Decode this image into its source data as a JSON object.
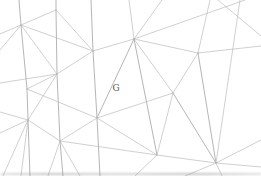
{
  "figure": {
    "background": "#ffffff",
    "label": {
      "text": "G",
      "x": 116,
      "y": 89,
      "color": "#5a5a5a",
      "font_size": 9
    },
    "line_color_normal": "#b7b7b7",
    "line_color_bold": "#a6a6a6",
    "bottom_edge_color": "#969696",
    "vertices": [
      [
        21,
        25
      ],
      [
        56,
        10
      ],
      [
        93,
        51
      ],
      [
        134,
        39
      ],
      [
        198,
        53
      ],
      [
        57,
        74
      ],
      [
        27,
        89
      ],
      [
        28,
        120
      ],
      [
        97,
        118
      ],
      [
        173,
        93
      ],
      [
        60,
        141
      ],
      [
        157,
        155
      ],
      [
        216,
        163
      ]
    ],
    "segments": [
      [
        56,
        0,
        56,
        10,
        "b"
      ],
      [
        56,
        10,
        57,
        74,
        "b"
      ],
      [
        57,
        74,
        60,
        141,
        "b"
      ],
      [
        60,
        141,
        63,
        176,
        "b"
      ],
      [
        91,
        0,
        93,
        51,
        "b"
      ],
      [
        93,
        51,
        97,
        118,
        "b"
      ],
      [
        97,
        118,
        100,
        176,
        "b"
      ],
      [
        19,
        0,
        21,
        25,
        "b"
      ],
      [
        21,
        25,
        27,
        89,
        "b"
      ],
      [
        27,
        89,
        28,
        120,
        "b"
      ],
      [
        28,
        120,
        30,
        176,
        "b"
      ],
      [
        56,
        10,
        0,
        34,
        "n"
      ],
      [
        21,
        25,
        93,
        51,
        "n"
      ],
      [
        21,
        25,
        57,
        74,
        "n"
      ],
      [
        21,
        25,
        0,
        50,
        "n"
      ],
      [
        56,
        10,
        93,
        51,
        "n"
      ],
      [
        93,
        51,
        134,
        39,
        "n"
      ],
      [
        93,
        51,
        57,
        74,
        "n"
      ],
      [
        134,
        39,
        129,
        0,
        "n"
      ],
      [
        134,
        39,
        162,
        0,
        "n"
      ],
      [
        134,
        39,
        245,
        0,
        "n"
      ],
      [
        134,
        39,
        198,
        53,
        "n"
      ],
      [
        134,
        39,
        97,
        118,
        "b"
      ],
      [
        134,
        39,
        157,
        155,
        "b"
      ],
      [
        134,
        39,
        173,
        93,
        "n"
      ],
      [
        198,
        53,
        210,
        0,
        "n"
      ],
      [
        198,
        53,
        261,
        46,
        "n"
      ],
      [
        198,
        53,
        173,
        93,
        "n"
      ],
      [
        198,
        53,
        216,
        163,
        "b"
      ],
      [
        57,
        74,
        28,
        120,
        "n"
      ],
      [
        57,
        74,
        0,
        83,
        "n"
      ],
      [
        27,
        89,
        57,
        74,
        "n"
      ],
      [
        27,
        89,
        97,
        118,
        "n"
      ],
      [
        28,
        120,
        60,
        141,
        "n"
      ],
      [
        28,
        120,
        0,
        112,
        "n"
      ],
      [
        28,
        120,
        0,
        133,
        "n"
      ],
      [
        28,
        120,
        3,
        176,
        "n"
      ],
      [
        28,
        120,
        21,
        176,
        "n"
      ],
      [
        97,
        118,
        173,
        93,
        "n"
      ],
      [
        97,
        118,
        60,
        141,
        "n"
      ],
      [
        97,
        118,
        157,
        155,
        "n"
      ],
      [
        173,
        93,
        216,
        163,
        "b"
      ],
      [
        173,
        93,
        157,
        155,
        "n"
      ],
      [
        60,
        141,
        48,
        176,
        "n"
      ],
      [
        60,
        141,
        80,
        176,
        "n"
      ],
      [
        60,
        141,
        157,
        155,
        "n"
      ],
      [
        157,
        155,
        216,
        163,
        "n"
      ],
      [
        157,
        155,
        135,
        176,
        "n"
      ],
      [
        216,
        163,
        240,
        0,
        "n"
      ],
      [
        216,
        163,
        261,
        140,
        "n"
      ],
      [
        216,
        163,
        261,
        167,
        "n"
      ],
      [
        216,
        163,
        185,
        176,
        "n"
      ],
      [
        216,
        163,
        222,
        176,
        "n"
      ],
      [
        218,
        0,
        261,
        36,
        "n"
      ]
    ]
  }
}
